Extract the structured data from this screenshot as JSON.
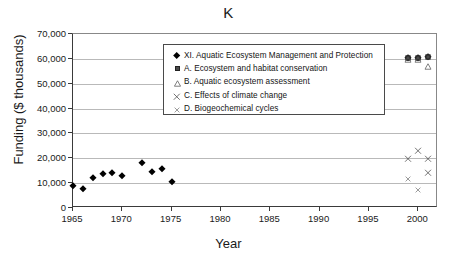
{
  "chart_data": {
    "type": "scatter",
    "title": "K",
    "xlabel": "Year",
    "ylabel": "Funding ($ thousands)",
    "xlim": [
      1965,
      2002
    ],
    "ylim": [
      0,
      70000
    ],
    "grid": true,
    "legend_position": "inside-upper-center",
    "x_ticks": [
      "1965",
      "1970",
      "1975",
      "1980",
      "1985",
      "1990",
      "1995",
      "2000"
    ],
    "x_tick_values": [
      1965,
      1970,
      1975,
      1980,
      1985,
      1990,
      1995,
      2000
    ],
    "y_ticks": [
      "0",
      "10,000",
      "20,000",
      "30,000",
      "40,000",
      "50,000",
      "60,000",
      "70,000"
    ],
    "y_tick_values": [
      0,
      10000,
      20000,
      30000,
      40000,
      50000,
      60000,
      70000
    ],
    "series": [
      {
        "name": "XI. Aquatic Ecosystem Management and Protection",
        "marker": "diamond",
        "color": "#000000",
        "points": [
          {
            "x": 1965,
            "y": 9000
          },
          {
            "x": 1966,
            "y": 7500
          },
          {
            "x": 1967,
            "y": 12000
          },
          {
            "x": 1968,
            "y": 13500
          },
          {
            "x": 1969,
            "y": 14000
          },
          {
            "x": 1970,
            "y": 13000
          },
          {
            "x": 1972,
            "y": 18000
          },
          {
            "x": 1973,
            "y": 14500
          },
          {
            "x": 1974,
            "y": 15500
          },
          {
            "x": 1975,
            "y": 10500
          },
          {
            "x": 1999,
            "y": 60500
          },
          {
            "x": 2000,
            "y": 60500
          },
          {
            "x": 2001,
            "y": 60800
          }
        ]
      },
      {
        "name": "A. Ecosystem and habitat conservation",
        "marker": "square",
        "color": "#4a4a4a",
        "points": [
          {
            "x": 1999,
            "y": 60500
          },
          {
            "x": 2000,
            "y": 60500
          },
          {
            "x": 2001,
            "y": 60800
          }
        ]
      },
      {
        "name": "B. Aquatic ecosystem assessment",
        "marker": "triangle",
        "color": "#4a4a4a",
        "points": [
          {
            "x": 1999,
            "y": 60300
          },
          {
            "x": 2000,
            "y": 60300
          },
          {
            "x": 2001,
            "y": 57500
          }
        ]
      },
      {
        "name": "C. Effects of climate change",
        "marker": "x-large",
        "color": "#555555",
        "points": [
          {
            "x": 1999,
            "y": 20500
          },
          {
            "x": 2000,
            "y": 23500
          },
          {
            "x": 2001,
            "y": 20500
          },
          {
            "x": 2001,
            "y": 14500
          }
        ]
      },
      {
        "name": "D. Biogeochemical cycles",
        "marker": "x-small",
        "color": "#666666",
        "points": [
          {
            "x": 1999,
            "y": 12500
          },
          {
            "x": 2000,
            "y": 8000
          }
        ]
      }
    ]
  },
  "legend": {
    "items": [
      {
        "marker": "diamond",
        "label": "XI. Aquatic Ecosystem Management and Protection"
      },
      {
        "marker": "square",
        "label": "A. Ecosystem and habitat conservation"
      },
      {
        "marker": "triangle",
        "label": "B. Aquatic ecosystem assessment"
      },
      {
        "marker": "x-large",
        "label": "C. Effects of climate change"
      },
      {
        "marker": "x-small",
        "label": "D. Biogeochemical cycles"
      }
    ]
  }
}
